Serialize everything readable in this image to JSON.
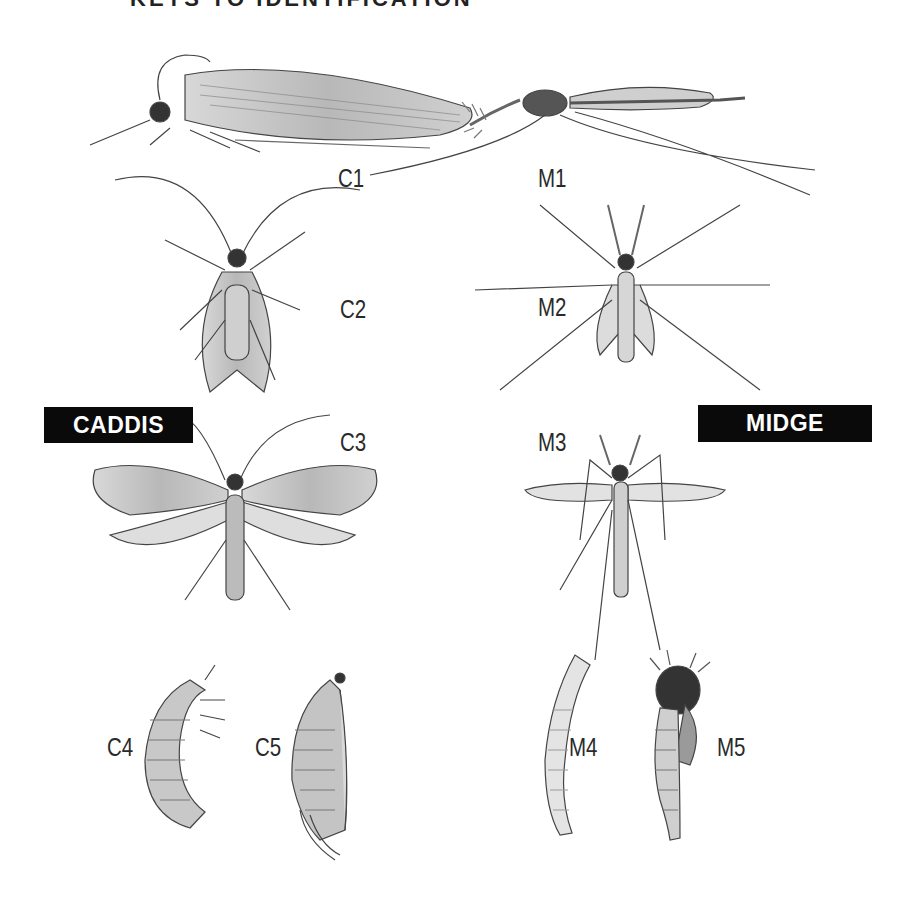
{
  "plate": {
    "partial_title": "KEYS TO IDENTIFICATION",
    "groups": {
      "caddis": {
        "tag": "CADDIS",
        "tag_bg": "#0a0a0a",
        "tag_fg": "#ffffff"
      },
      "midge": {
        "tag": "MIDGE",
        "tag_bg": "#0a0a0a",
        "tag_fg": "#ffffff"
      }
    },
    "labels": {
      "c1": "C1",
      "c2": "C2",
      "c3": "C3",
      "c4": "C4",
      "c5": "C5",
      "m1": "M1",
      "m2": "M2",
      "m3": "M3",
      "m4": "M4",
      "m5": "M5"
    },
    "figures": [
      {
        "id": "C1",
        "group": "caddis",
        "view": "adult side view, wings folded tent-like"
      },
      {
        "id": "C2",
        "group": "caddis",
        "view": "adult dorsal view, wings folded"
      },
      {
        "id": "C3",
        "group": "caddis",
        "view": "adult dorsal view, wings spread"
      },
      {
        "id": "C4",
        "group": "caddis",
        "view": "larva"
      },
      {
        "id": "C5",
        "group": "caddis",
        "view": "pupa"
      },
      {
        "id": "M1",
        "group": "midge",
        "view": "adult side view"
      },
      {
        "id": "M2",
        "group": "midge",
        "view": "adult dorsal view, wings folded"
      },
      {
        "id": "M3",
        "group": "midge",
        "view": "adult dorsal view, wings spread"
      },
      {
        "id": "M4",
        "group": "midge",
        "view": "larva"
      },
      {
        "id": "M5",
        "group": "midge",
        "view": "pupa"
      }
    ]
  }
}
